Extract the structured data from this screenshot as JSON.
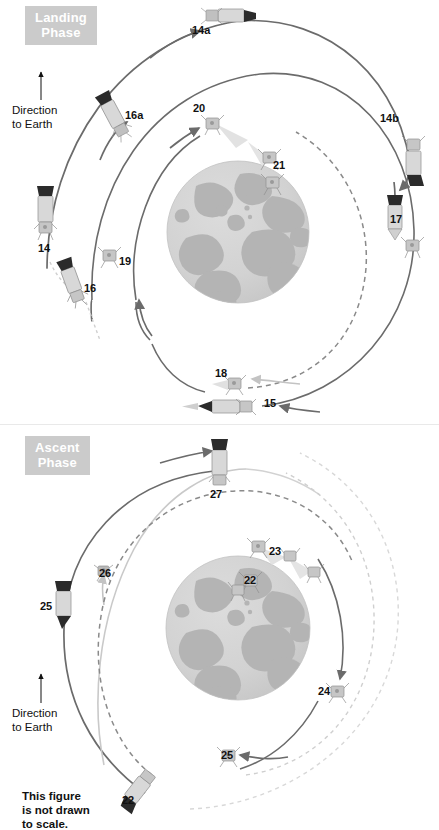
{
  "figure": {
    "scale_note": "This figure\nis not drawn\nto scale.",
    "direction_label": "Direction\nto Earth",
    "colors": {
      "orbit_dark": "#6b6b6b",
      "orbit_light": "#c9c9c9",
      "orbit_dashed": "#8a8a8a",
      "orbit_dashed_light": "#cfcfcf",
      "moon_base": "#d3d3d3",
      "moon_maria": "#b4b4b4",
      "badge_bg": "#cbcbcb",
      "badge_text": "#ffffff",
      "label_text": "#111111"
    }
  },
  "landing_phase": {
    "badge": {
      "line1": "Landing",
      "line2": "Phase"
    },
    "direction_label": "Direction\nto Earth",
    "markers": [
      {
        "id": "14a",
        "label": "14a",
        "x": 200,
        "y": 30,
        "craft": "csm-lm-horizontal"
      },
      {
        "id": "14b",
        "label": "14b",
        "x": 387,
        "y": 120,
        "craft": "none"
      },
      {
        "id": "16a",
        "label": "16a",
        "x": 126,
        "y": 116,
        "craft": "lm-descent-tilted"
      },
      {
        "id": "20",
        "label": "20",
        "x": 199,
        "y": 108,
        "craft": "lm-ascent"
      },
      {
        "id": "21",
        "label": "21",
        "x": 279,
        "y": 165,
        "craft": "lm-lander"
      },
      {
        "id": "17",
        "label": "17",
        "x": 396,
        "y": 220,
        "craft": "csm-vertical"
      },
      {
        "id": "14",
        "label": "14",
        "x": 45,
        "y": 248,
        "craft": "csm-lm-vertical"
      },
      {
        "id": "19",
        "label": "19",
        "x": 124,
        "y": 261,
        "craft": "lm-ascent"
      },
      {
        "id": "16",
        "label": "16",
        "x": 89,
        "y": 288,
        "craft": "lm-descent-tilted"
      },
      {
        "id": "18",
        "label": "18",
        "x": 222,
        "y": 375,
        "craft": "lm-ascent"
      },
      {
        "id": "15",
        "label": "15",
        "x": 271,
        "y": 404,
        "craft": "csm-lm-horizontal"
      }
    ]
  },
  "ascent_phase": {
    "badge": {
      "line1": "Ascent",
      "line2": "Phase"
    },
    "direction_label": "Direction\nto Earth",
    "scale_note": "This figure\nis not drawn\nto scale.",
    "markers": [
      {
        "id": "27",
        "label": "27",
        "x": 217,
        "y": 470,
        "craft": "csm-vertical"
      },
      {
        "id": "23",
        "label": "23",
        "x": 276,
        "y": 551,
        "craft": "lm-ascent"
      },
      {
        "id": "22a",
        "label": "22",
        "x": 251,
        "y": 580,
        "craft": "lm-lander"
      },
      {
        "id": "26",
        "label": "26",
        "x": 104,
        "y": 573,
        "craft": "lm-small"
      },
      {
        "id": "25a",
        "label": "25",
        "x": 46,
        "y": 606,
        "craft": "csm-vertical"
      },
      {
        "id": "24",
        "label": "24",
        "x": 325,
        "y": 691,
        "craft": "lm-ascent"
      },
      {
        "id": "25b",
        "label": "25",
        "x": 228,
        "y": 755,
        "craft": "lm-ascent"
      },
      {
        "id": "22b",
        "label": "22",
        "x": 129,
        "y": 795,
        "craft": "lm-descent-tilted"
      }
    ]
  }
}
